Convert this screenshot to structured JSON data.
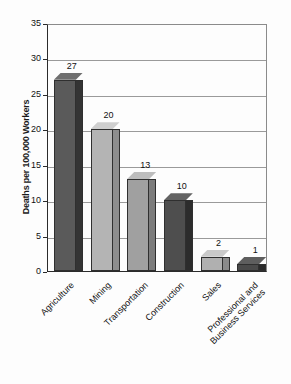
{
  "chart_data": {
    "type": "bar",
    "title": "",
    "xlabel": "",
    "ylabel": "Deaths per 100,000 Workers",
    "categories": [
      "Agriculture",
      "Mining",
      "Transportation",
      "Construction",
      "Sales",
      "Professional and Business Services"
    ],
    "category_lines": [
      [
        "Agriculture"
      ],
      [
        "Mining"
      ],
      [
        "Transportation"
      ],
      [
        "Construction"
      ],
      [
        "Sales"
      ],
      [
        "Professional and",
        "Business Services"
      ]
    ],
    "values": [
      27,
      20,
      13,
      10,
      2,
      1
    ],
    "value_labels": [
      "27",
      "20",
      "13",
      "10",
      "2",
      "1"
    ],
    "ylim": [
      0,
      35
    ],
    "yticks": [
      0,
      5,
      10,
      15,
      20,
      25,
      30,
      35
    ],
    "ytick_labels": [
      "0",
      "5",
      "10",
      "15",
      "20",
      "25",
      "30",
      "35"
    ],
    "grid": true,
    "legend": "none",
    "bar_colors": [
      "#5a5a5a",
      "#b4b4b4",
      "#a0a0a0",
      "#4e4e4e",
      "#b0b0b0",
      "#4a4a4a"
    ],
    "bar_side_colors": [
      "#343434",
      "#8d8d8d",
      "#7c7c7c",
      "#2c2c2c",
      "#8a8a8a",
      "#2a2a2a"
    ],
    "bar_top_colors": [
      "#6f6f6f",
      "#cfcfcf",
      "#bdbdbd",
      "#636363",
      "#c9c9c9",
      "#5e5e5e"
    ]
  },
  "colors": {
    "background": "#fdfdfd",
    "axis": "#2b2b2b",
    "grid": "#9a9a9a",
    "text": "#111111"
  }
}
